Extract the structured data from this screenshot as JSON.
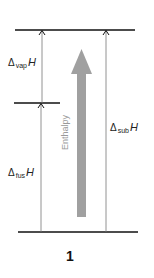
{
  "diagram": {
    "title_number": "1",
    "axis_label": "Enthalpy",
    "labels": {
      "vap": {
        "delta": "Δ",
        "sub": "vap",
        "var": "H"
      },
      "fus": {
        "delta": "Δ",
        "sub": "fus",
        "var": "H"
      },
      "sub": {
        "delta": "Δ",
        "sub": "sub",
        "var": "H"
      }
    },
    "levels": [
      {
        "name": "gas",
        "y": 30
      },
      {
        "name": "liquid",
        "y": 103
      },
      {
        "name": "solid",
        "y": 232
      }
    ],
    "colors": {
      "level_line": "#111111",
      "transition_arrow": "#777777",
      "enthalpy_arrow": "#a0a0a0"
    }
  }
}
